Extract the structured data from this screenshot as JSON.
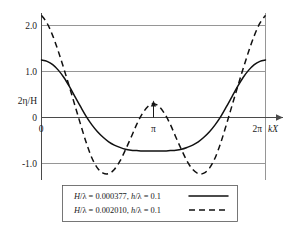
{
  "chart_data": {
    "type": "line",
    "title": "",
    "xlabel": "kX",
    "ylabel": "2η/H",
    "xlim": [
      0,
      6.283185
    ],
    "ylim": [
      -1.45,
      2.35
    ],
    "grid": true,
    "legend_position": "below-plot",
    "x_tick_labels": [
      "0",
      "π",
      "2π"
    ],
    "x_tick_values": [
      0,
      3.141593,
      6.283185
    ],
    "y_tick_labels": [
      "2.0",
      "1.0",
      "0",
      "-1.0"
    ],
    "y_tick_values": [
      2.0,
      1.0,
      0,
      -1.0
    ],
    "annotations": [
      {
        "text": "π",
        "x": 3.141593,
        "y": 0,
        "marker": "up-arrow"
      }
    ],
    "series": [
      {
        "name": "H/λ = 0.000377, h/λ = 0.1",
        "style": "solid",
        "color": "#111111",
        "x": [
          0.0,
          0.157,
          0.314,
          0.471,
          0.628,
          0.785,
          0.942,
          1.1,
          1.257,
          1.414,
          1.571,
          1.728,
          1.885,
          2.042,
          2.199,
          2.356,
          2.513,
          2.67,
          2.827,
          2.985,
          3.142,
          3.299,
          3.456,
          3.613,
          3.77,
          3.927,
          4.084,
          4.241,
          4.398,
          4.555,
          4.712,
          4.869,
          5.027,
          5.184,
          5.341,
          5.498,
          5.655,
          5.812,
          5.969,
          6.126,
          6.283
        ],
        "y": [
          1.25,
          1.22,
          1.15,
          1.03,
          0.87,
          0.67,
          0.45,
          0.23,
          0.02,
          -0.16,
          -0.31,
          -0.43,
          -0.53,
          -0.6,
          -0.65,
          -0.69,
          -0.71,
          -0.72,
          -0.73,
          -0.73,
          -0.73,
          -0.73,
          -0.73,
          -0.72,
          -0.71,
          -0.69,
          -0.65,
          -0.6,
          -0.53,
          -0.43,
          -0.31,
          -0.16,
          0.02,
          0.23,
          0.45,
          0.67,
          0.87,
          1.03,
          1.15,
          1.22,
          1.25
        ]
      },
      {
        "name": "H/λ = 0.002010, h/λ = 0.1",
        "style": "dashed",
        "color": "#111111",
        "x": [
          0.0,
          0.157,
          0.314,
          0.471,
          0.628,
          0.785,
          0.942,
          1.1,
          1.257,
          1.414,
          1.571,
          1.728,
          1.885,
          2.042,
          2.199,
          2.356,
          2.513,
          2.67,
          2.827,
          2.985,
          3.142,
          3.299,
          3.456,
          3.613,
          3.77,
          3.927,
          4.084,
          4.241,
          4.398,
          4.555,
          4.712,
          4.869,
          5.027,
          5.184,
          5.341,
          5.498,
          5.655,
          5.812,
          5.969,
          6.126,
          6.283
        ],
        "y": [
          2.22,
          2.05,
          1.78,
          1.44,
          1.06,
          0.66,
          0.25,
          -0.16,
          -0.55,
          -0.88,
          -1.1,
          -1.21,
          -1.22,
          -1.13,
          -0.95,
          -0.7,
          -0.43,
          -0.15,
          0.08,
          0.24,
          0.3,
          0.24,
          0.08,
          -0.15,
          -0.43,
          -0.7,
          -0.95,
          -1.13,
          -1.22,
          -1.21,
          -1.1,
          -0.88,
          -0.55,
          -0.16,
          0.25,
          0.66,
          1.06,
          1.44,
          1.78,
          2.05,
          2.22
        ]
      }
    ]
  },
  "legend": {
    "entries": [
      {
        "label_parts": {
          "h_sym": "H/λ",
          "eq1": " = ",
          "value1": "0.000377",
          "comma": ", ",
          "h_small": "h/λ",
          "eq2": " = ",
          "value2": "0.1"
        },
        "full_label": "H/λ = 0.000377, h/λ = 0.1",
        "style": "solid"
      },
      {
        "label_parts": {
          "h_sym": "H/λ",
          "eq1": " = ",
          "value1": "0.002010",
          "comma": ", ",
          "h_small": "h/λ",
          "eq2": " = ",
          "value2": "0.1"
        },
        "full_label": "H/λ = 0.002010, h/λ = 0.1",
        "style": "dashed"
      }
    ]
  },
  "axes": {
    "y_label": "2η/H",
    "x_label": "kX",
    "x_origin_label": "0",
    "x_mid_label": "π",
    "x_end_label": "2π",
    "y_ticks": [
      "2.0",
      "1.0",
      "0",
      "-1.0"
    ]
  },
  "colors": {
    "curve": "#111111",
    "grid": "#8a8a8a",
    "axis": "#4a4a4a",
    "background": "#ffffff",
    "legend_border": "#555555"
  }
}
